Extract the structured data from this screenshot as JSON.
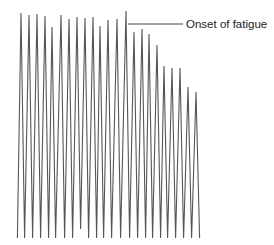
{
  "chart_data": {
    "type": "line",
    "title": "",
    "xlabel": "",
    "ylabel": "",
    "grid": false,
    "legend": null,
    "trough_y": 238,
    "peaks": [
      {
        "x": 21,
        "y": 13
      },
      {
        "x": 29,
        "y": 15
      },
      {
        "x": 37,
        "y": 14
      },
      {
        "x": 45,
        "y": 16
      },
      {
        "x": 52,
        "y": 27
      },
      {
        "x": 61,
        "y": 15
      },
      {
        "x": 69,
        "y": 19
      },
      {
        "x": 77,
        "y": 17
      },
      {
        "x": 85,
        "y": 18
      },
      {
        "x": 93,
        "y": 17
      },
      {
        "x": 100,
        "y": 26
      },
      {
        "x": 108,
        "y": 20
      },
      {
        "x": 117,
        "y": 19
      },
      {
        "x": 126,
        "y": 11
      },
      {
        "x": 134,
        "y": 32
      },
      {
        "x": 142,
        "y": 29
      },
      {
        "x": 149,
        "y": 34
      },
      {
        "x": 157,
        "y": 45
      },
      {
        "x": 164,
        "y": 66
      },
      {
        "x": 172,
        "y": 68
      },
      {
        "x": 180,
        "y": 68
      },
      {
        "x": 188,
        "y": 87
      },
      {
        "x": 196,
        "y": 92
      }
    ],
    "trough_overrides": [
      {
        "after_peak_index": 7,
        "y": 229
      }
    ],
    "annotations": [
      {
        "text": "Onset of fatigue",
        "line": {
          "x1": 128,
          "y1": 24,
          "x2": 183,
          "y2": 24
        },
        "text_x": 186,
        "text_y": 28
      }
    ]
  },
  "labels": {
    "onset": "Onset of fatigue"
  }
}
